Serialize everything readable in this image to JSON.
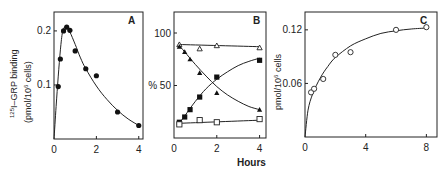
{
  "figure": {
    "xlabel_shared": "Hours"
  },
  "chart_data": [
    {
      "panel": "A",
      "type": "scatter",
      "title": "",
      "panel_letter": "A",
      "xlabel": "",
      "ylabel_line1": "125I–GRP binding",
      "ylabel_line2": "(pmol/10^6 cells)",
      "ylabel": "125I-GRP binding (pmol/10^6 cells)",
      "xlim": [
        0,
        4.2
      ],
      "ylim": [
        0,
        0.235
      ],
      "xticks": [
        0,
        2,
        4
      ],
      "xtick_labels": [
        "0",
        "2",
        "4"
      ],
      "yticks": [
        0.1,
        0.2
      ],
      "ytick_labels": [
        "0.1",
        "0.2"
      ],
      "grid": false,
      "series": [
        {
          "name": "125I-GRP binding",
          "marker": "filled-circle",
          "x": [
            0.2,
            0.3,
            0.45,
            0.6,
            0.75,
            1.0,
            1.5,
            2.0,
            3.0,
            4.0
          ],
          "y": [
            0.097,
            0.148,
            0.2,
            0.207,
            0.201,
            0.163,
            0.13,
            0.117,
            0.05,
            0.025
          ]
        }
      ],
      "fit_curve": {
        "x": [
          0,
          0.1,
          0.2,
          0.3,
          0.4,
          0.5,
          0.6,
          0.75,
          1.0,
          1.25,
          1.5,
          2.0,
          2.5,
          3.0,
          3.5,
          4.0
        ],
        "y": [
          0,
          0.06,
          0.115,
          0.165,
          0.198,
          0.207,
          0.206,
          0.198,
          0.175,
          0.15,
          0.13,
          0.098,
          0.073,
          0.053,
          0.037,
          0.025
        ]
      }
    },
    {
      "panel": "B",
      "type": "line",
      "title": "",
      "panel_letter": "B",
      "xlabel": "Hours",
      "ylabel": "%",
      "xlim": [
        0,
        4.3
      ],
      "ylim": [
        0,
        120
      ],
      "xticks": [
        0,
        2,
        4
      ],
      "xtick_labels": [
        "0",
        "2",
        "4"
      ],
      "yticks": [
        50,
        100
      ],
      "ytick_labels": [
        "% 50",
        "100"
      ],
      "grid": false,
      "series": [
        {
          "name": "open-triangle",
          "marker": "open-triangle",
          "x": [
            0.25,
            1.2,
            2.0,
            4.0
          ],
          "y": [
            89,
            85,
            88,
            86
          ],
          "fit": {
            "x": [
              0.25,
              4.0
            ],
            "y": [
              89,
              87
            ]
          }
        },
        {
          "name": "filled-triangle",
          "marker": "filled-triangle",
          "x": [
            0.25,
            0.5,
            0.75,
            1.2,
            2.0,
            4.0
          ],
          "y": [
            87,
            82,
            75,
            62,
            43,
            27
          ],
          "fit": {
            "x": [
              0.25,
              0.5,
              1.0,
              1.5,
              2.0,
              2.5,
              3.0,
              3.5,
              4.0
            ],
            "y": [
              88,
              82,
              70,
              59,
              49,
              41,
              35,
              30,
              27
            ]
          }
        },
        {
          "name": "filled-square",
          "marker": "filled-square",
          "x": [
            0.25,
            0.5,
            0.75,
            1.2,
            2.0,
            4.0
          ],
          "y": [
            15,
            20,
            27,
            39,
            58,
            74
          ],
          "fit": {
            "x": [
              0.25,
              0.5,
              1.0,
              1.5,
              2.0,
              2.5,
              3.0,
              3.5,
              4.0
            ],
            "y": [
              14,
              21,
              35,
              47,
              56,
              63,
              69,
              73,
              76
            ]
          }
        },
        {
          "name": "open-square",
          "marker": "open-square",
          "x": [
            0.25,
            1.2,
            2.0,
            4.0
          ],
          "y": [
            13,
            17,
            15,
            18
          ],
          "fit": {
            "x": [
              0.25,
              4.0
            ],
            "y": [
              14,
              17
            ]
          }
        }
      ]
    },
    {
      "panel": "C",
      "type": "scatter",
      "title": "",
      "panel_letter": "C",
      "xlabel": "",
      "ylabel": "pmol/10^6 cells",
      "xlim": [
        0,
        8.7
      ],
      "ylim": [
        0,
        0.14
      ],
      "xticks": [
        0,
        4,
        8
      ],
      "xtick_labels": [
        "0",
        "4",
        "8"
      ],
      "yticks": [
        0.06,
        0.12
      ],
      "ytick_labels": [
        "0.06",
        "0.12"
      ],
      "grid": false,
      "series": [
        {
          "name": "binding",
          "marker": "open-circle",
          "x": [
            0.4,
            0.6,
            1.2,
            2.0,
            3.0,
            6.0,
            8.0
          ],
          "y": [
            0.05,
            0.054,
            0.065,
            0.092,
            0.095,
            0.12,
            0.123
          ]
        }
      ],
      "fit_curve": {
        "x": [
          0,
          0.2,
          0.5,
          1.0,
          1.5,
          2.0,
          3.0,
          4.0,
          5.0,
          6.0,
          7.0,
          8.0
        ],
        "y": [
          0,
          0.03,
          0.048,
          0.066,
          0.079,
          0.089,
          0.102,
          0.11,
          0.116,
          0.119,
          0.121,
          0.122
        ]
      }
    }
  ]
}
